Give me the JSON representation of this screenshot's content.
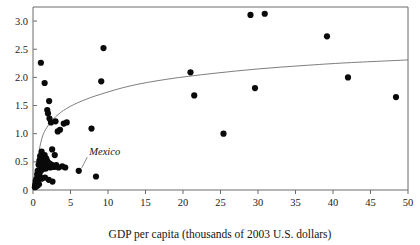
{
  "figure": {
    "kind": "scatter-plot",
    "background": "#ffffff",
    "point_color": "#0a0a0a",
    "axis_color": "#6b6b6b",
    "trend_color": "#6f6f6f",
    "cropped_caption_fragment": ""
  },
  "chart_data": {
    "type": "scatter",
    "title": "",
    "xlabel": "GDP per capita (thousands of 2003 U.S. dollars)",
    "ylabel": "",
    "xlim": [
      0,
      50
    ],
    "ylim": [
      0,
      3.25
    ],
    "xticks": [
      0,
      5,
      10,
      15,
      20,
      25,
      30,
      35,
      40,
      45,
      50
    ],
    "xticklabels": [
      "0",
      "5",
      "10",
      "15",
      "20",
      "25",
      "30",
      "35",
      "40",
      "45",
      "50"
    ],
    "yticks": [
      0.5,
      1.0,
      1.5,
      2.0,
      2.5,
      3.0
    ],
    "yticklabels": [
      "0.5",
      "1.0",
      "1.5",
      "2.0",
      "2.5",
      "3.0"
    ],
    "grid": false,
    "legend": "none",
    "marker": "filled-circle",
    "marker_size_px": 3.1,
    "points": [
      [
        0.25,
        0.05
      ],
      [
        0.3,
        0.1
      ],
      [
        0.35,
        0.16
      ],
      [
        0.4,
        0.06
      ],
      [
        0.45,
        0.2
      ],
      [
        0.5,
        0.12
      ],
      [
        0.55,
        0.28
      ],
      [
        0.6,
        0.08
      ],
      [
        0.62,
        0.34
      ],
      [
        0.7,
        0.18
      ],
      [
        0.75,
        0.45
      ],
      [
        0.8,
        0.1
      ],
      [
        0.85,
        0.52
      ],
      [
        0.9,
        0.3
      ],
      [
        0.95,
        0.6
      ],
      [
        1.0,
        0.22
      ],
      [
        1.05,
        0.4
      ],
      [
        1.1,
        0.55
      ],
      [
        1.15,
        0.68
      ],
      [
        1.2,
        0.36
      ],
      [
        1.3,
        0.48
      ],
      [
        1.35,
        0.58
      ],
      [
        1.4,
        0.44
      ],
      [
        1.45,
        0.5
      ],
      [
        1.5,
        0.42
      ],
      [
        1.55,
        0.62
      ],
      [
        1.6,
        0.47
      ],
      [
        1.7,
        0.38
      ],
      [
        1.75,
        0.56
      ],
      [
        1.8,
        0.46
      ],
      [
        1.85,
        0.52
      ],
      [
        1.9,
        0.44
      ],
      [
        2.0,
        0.49
      ],
      [
        2.1,
        0.43
      ],
      [
        2.2,
        0.47
      ],
      [
        2.3,
        0.4
      ],
      [
        2.45,
        0.45
      ],
      [
        2.6,
        0.42
      ],
      [
        2.8,
        0.41
      ],
      [
        3.1,
        0.44
      ],
      [
        3.4,
        0.4
      ],
      [
        3.9,
        0.42
      ],
      [
        4.3,
        0.4
      ],
      [
        1.15,
        0.2
      ],
      [
        1.6,
        0.22
      ],
      [
        2.1,
        0.18
      ],
      [
        2.6,
        0.15
      ],
      [
        1.05,
        2.26
      ],
      [
        1.55,
        1.9
      ],
      [
        2.15,
        1.58
      ],
      [
        1.9,
        1.42
      ],
      [
        2.0,
        1.36
      ],
      [
        2.2,
        1.27
      ],
      [
        2.4,
        1.2
      ],
      [
        3.0,
        1.22
      ],
      [
        3.3,
        1.04
      ],
      [
        3.6,
        1.07
      ],
      [
        4.1,
        1.18
      ],
      [
        4.5,
        1.2
      ],
      [
        2.55,
        0.72
      ],
      [
        2.9,
        0.62
      ],
      [
        6.1,
        0.34
      ],
      [
        8.4,
        0.24
      ],
      [
        7.8,
        1.09
      ],
      [
        9.4,
        2.52
      ],
      [
        9.1,
        1.93
      ],
      [
        21.0,
        2.09
      ],
      [
        21.5,
        1.68
      ],
      [
        25.4,
        1.0
      ],
      [
        29.0,
        3.11
      ],
      [
        30.9,
        3.13
      ],
      [
        29.6,
        1.81
      ],
      [
        39.2,
        2.73
      ],
      [
        42.0,
        2.0
      ],
      [
        48.4,
        1.65
      ]
    ],
    "trend": {
      "kind": "logarithmic-fit",
      "description": "rising concave curve from near origin to upper right",
      "path_points": [
        [
          0.35,
          0.05
        ],
        [
          0.5,
          0.33
        ],
        [
          0.7,
          0.58
        ],
        [
          1.0,
          0.82
        ],
        [
          1.4,
          1.0
        ],
        [
          2.0,
          1.14
        ],
        [
          3.0,
          1.3
        ],
        [
          4.5,
          1.45
        ],
        [
          6.5,
          1.58
        ],
        [
          9.0,
          1.7
        ],
        [
          13.0,
          1.85
        ],
        [
          18.0,
          1.97
        ],
        [
          24.0,
          2.07
        ],
        [
          30.0,
          2.15
        ],
        [
          36.0,
          2.21
        ],
        [
          42.0,
          2.26
        ],
        [
          50.0,
          2.31
        ]
      ]
    },
    "annotations": [
      {
        "label": "Mexico",
        "text_x": 7.5,
        "text_y": 0.62,
        "point_x": 6.1,
        "point_y": 0.34,
        "style": "italic"
      }
    ]
  }
}
